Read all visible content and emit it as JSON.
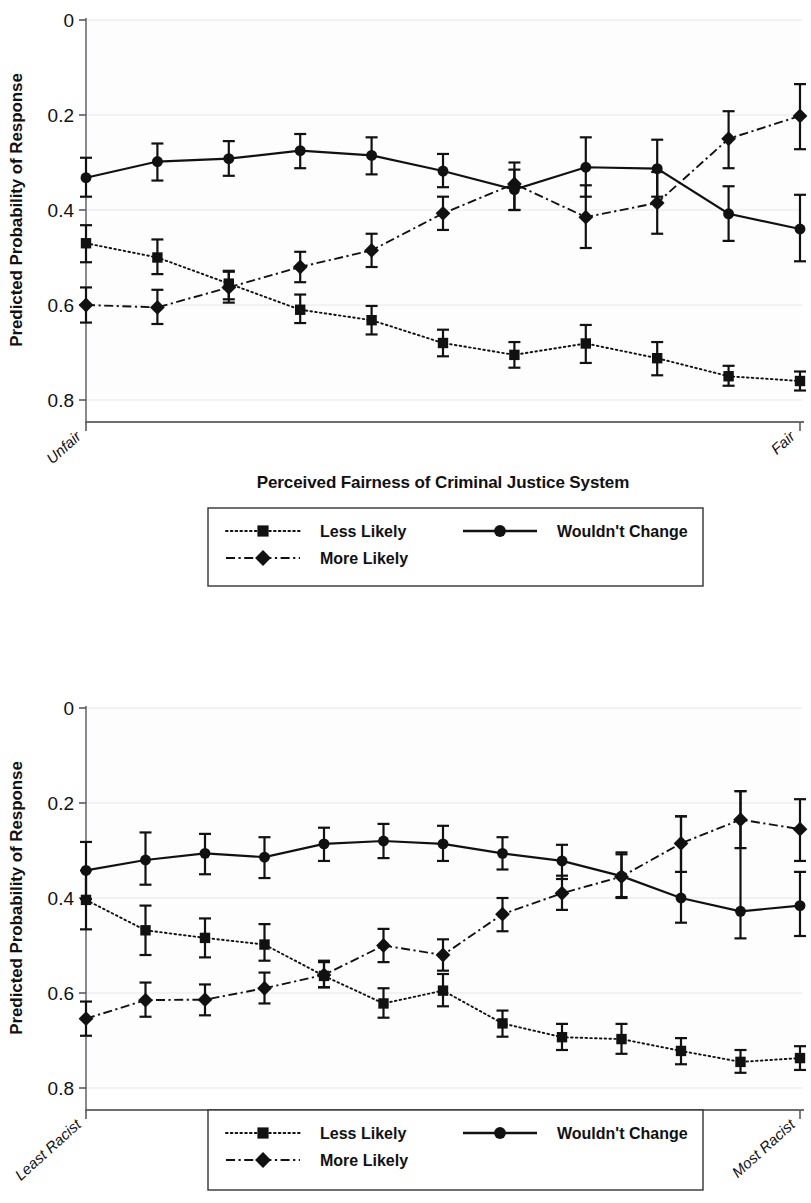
{
  "figure": {
    "panels": [
      {
        "id": "panel-1",
        "ylabel": "Predicted Probability of Response",
        "xlabel": "Perceived Fairness of Criminal Justice System",
        "xtick_left": "Unfair",
        "xtick_right": "Fair",
        "ytick_labels": [
          "0.8",
          "0.6",
          "0.4",
          "0.2",
          "0"
        ],
        "legend": {
          "items": [
            {
              "label": "Less Likely",
              "marker": "square",
              "dash": "dotted"
            },
            {
              "label": "Wouldn't Change",
              "marker": "circle",
              "dash": "solid"
            },
            {
              "label": "More Likely",
              "marker": "diamond",
              "dash": "dashdot"
            }
          ]
        }
      },
      {
        "id": "panel-2",
        "ylabel": "Predicted Probability of Response",
        "xlabel": "Racism - Laziness Stereotype",
        "xtick_left": "Least Racist",
        "xtick_right": "Most Racist",
        "ytick_labels": [
          "0.8",
          "0.6",
          "0.4",
          "0.2",
          "0"
        ],
        "legend": {
          "items": [
            {
              "label": "Less Likely",
              "marker": "square",
              "dash": "dotted"
            },
            {
              "label": "Wouldn't Change",
              "marker": "circle",
              "dash": "solid"
            },
            {
              "label": "More Likely",
              "marker": "diamond",
              "dash": "dashdot"
            }
          ]
        }
      }
    ]
  },
  "chart_data": [
    {
      "type": "line",
      "title": "",
      "xlabel": "Perceived Fairness of Criminal Justice System",
      "ylabel": "Predicted Probability of Response",
      "ylim": [
        0,
        0.8
      ],
      "yticks": [
        0,
        0.2,
        0.4,
        0.6,
        0.8
      ],
      "grid": true,
      "legend_position": "below",
      "x": [
        1,
        2,
        3,
        4,
        5,
        6,
        7,
        8,
        9,
        10,
        11
      ],
      "xtick_labels": {
        "first": "Unfair",
        "last": "Fair"
      },
      "series": [
        {
          "name": "Less Likely",
          "marker": "square",
          "dash": "dotted",
          "values": [
            0.33,
            0.3,
            0.245,
            0.19,
            0.168,
            0.12,
            0.095,
            0.119,
            0.088,
            0.05,
            0.04
          ],
          "err_low": [
            0.29,
            0.265,
            0.212,
            0.162,
            0.138,
            0.092,
            0.068,
            0.078,
            0.052,
            0.03,
            0.02
          ],
          "err_high": [
            0.368,
            0.338,
            0.272,
            0.222,
            0.198,
            0.148,
            0.122,
            0.158,
            0.122,
            0.072,
            0.06
          ]
        },
        {
          "name": "More Likely",
          "marker": "diamond",
          "dash": "dashdot",
          "values": [
            0.2,
            0.195,
            0.237,
            0.28,
            0.315,
            0.393,
            0.455,
            0.385,
            0.415,
            0.55,
            0.598
          ],
          "err_low": [
            0.163,
            0.16,
            0.205,
            0.248,
            0.28,
            0.358,
            0.4,
            0.32,
            0.35,
            0.488,
            0.528
          ],
          "err_high": [
            0.237,
            0.232,
            0.27,
            0.312,
            0.35,
            0.428,
            0.5,
            0.452,
            0.48,
            0.608,
            0.665
          ]
        },
        {
          "name": "Wouldn't Change",
          "marker": "circle",
          "dash": "solid",
          "values": [
            0.468,
            0.502,
            0.508,
            0.525,
            0.515,
            0.482,
            0.443,
            0.49,
            0.487,
            0.392,
            0.36
          ],
          "err_low": [
            0.428,
            0.462,
            0.472,
            0.488,
            0.475,
            0.448,
            0.4,
            0.428,
            0.428,
            0.335,
            0.292
          ],
          "err_high": [
            0.51,
            0.54,
            0.545,
            0.56,
            0.553,
            0.518,
            0.485,
            0.553,
            0.548,
            0.45,
            0.432
          ]
        }
      ]
    },
    {
      "type": "line",
      "title": "",
      "xlabel": "Racism - Laziness Stereotype",
      "ylabel": "Predicted Probability of Response",
      "ylim": [
        0,
        0.8
      ],
      "yticks": [
        0,
        0.2,
        0.4,
        0.6,
        0.8
      ],
      "grid": true,
      "legend_position": "below",
      "x": [
        1,
        2,
        3,
        4,
        5,
        6,
        7,
        8,
        9,
        10,
        11,
        12,
        13
      ],
      "xtick_labels": {
        "first": "Least Racist",
        "last": "Most Racist"
      },
      "series": [
        {
          "name": "Less Likely",
          "marker": "square",
          "dash": "dotted",
          "values": [
            0.396,
            0.332,
            0.316,
            0.302,
            0.236,
            0.178,
            0.205,
            0.136,
            0.107,
            0.103,
            0.078,
            0.055,
            0.063
          ],
          "err_low": [
            0.334,
            0.28,
            0.275,
            0.268,
            0.212,
            0.148,
            0.172,
            0.108,
            0.08,
            0.072,
            0.05,
            0.032,
            0.038
          ],
          "err_high": [
            0.458,
            0.384,
            0.357,
            0.345,
            0.265,
            0.21,
            0.24,
            0.163,
            0.135,
            0.135,
            0.105,
            0.08,
            0.088
          ]
        },
        {
          "name": "More Likely",
          "marker": "diamond",
          "dash": "dashdot",
          "values": [
            0.146,
            0.185,
            0.186,
            0.21,
            0.238,
            0.3,
            0.28,
            0.366,
            0.41,
            0.445,
            0.515,
            0.565,
            0.545
          ],
          "err_low": [
            0.11,
            0.15,
            0.153,
            0.178,
            0.212,
            0.265,
            0.247,
            0.33,
            0.375,
            0.402,
            0.455,
            0.505,
            0.478
          ],
          "err_high": [
            0.182,
            0.222,
            0.218,
            0.243,
            0.268,
            0.335,
            0.313,
            0.4,
            0.447,
            0.492,
            0.572,
            0.625,
            0.608
          ]
        },
        {
          "name": "Wouldn't Change",
          "marker": "circle",
          "dash": "solid",
          "values": [
            0.458,
            0.48,
            0.494,
            0.486,
            0.514,
            0.52,
            0.514,
            0.494,
            0.478,
            0.446,
            0.4,
            0.372,
            0.384
          ],
          "err_low": [
            0.398,
            0.428,
            0.45,
            0.442,
            0.478,
            0.484,
            0.478,
            0.46,
            0.44,
            0.4,
            0.348,
            0.315,
            0.32
          ],
          "err_high": [
            0.518,
            0.538,
            0.535,
            0.528,
            0.548,
            0.556,
            0.552,
            0.528,
            0.512,
            0.496,
            0.572,
            0.625,
            0.455
          ]
        }
      ]
    }
  ]
}
